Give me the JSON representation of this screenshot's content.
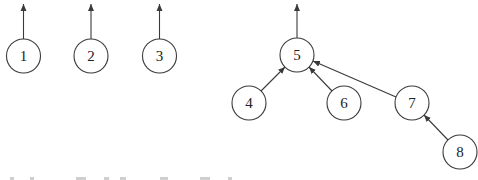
{
  "diagram": {
    "type": "disjoint-set forest",
    "nodes": [
      {
        "id": "1",
        "label": "1",
        "x": 23.5,
        "y": 56
      },
      {
        "id": "2",
        "label": "2",
        "x": 91,
        "y": 56
      },
      {
        "id": "3",
        "label": "3",
        "x": 159.5,
        "y": 56
      },
      {
        "id": "5",
        "label": "5",
        "x": 297,
        "y": 55
      },
      {
        "id": "4",
        "label": "4",
        "x": 249,
        "y": 103
      },
      {
        "id": "6",
        "label": "6",
        "x": 344,
        "y": 103
      },
      {
        "id": "7",
        "label": "7",
        "x": 412,
        "y": 103
      },
      {
        "id": "8",
        "label": "8",
        "x": 460,
        "y": 152
      }
    ],
    "root_arrows": [
      "1",
      "2",
      "3",
      "5"
    ],
    "edges": [
      {
        "from": "4",
        "to": "5"
      },
      {
        "from": "6",
        "to": "5"
      },
      {
        "from": "7",
        "to": "5"
      },
      {
        "from": "8",
        "to": "7"
      }
    ],
    "colors": {
      "stroke": "#3a3a3a",
      "background": "#ffffff"
    }
  }
}
